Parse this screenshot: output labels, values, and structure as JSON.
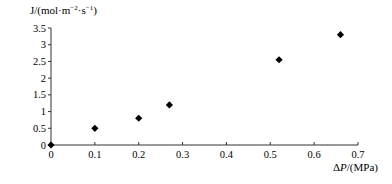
{
  "chart_data": {
    "type": "scatter",
    "title": "",
    "xlabel_prefix": "Δ",
    "xlabel_var": "P",
    "xlabel_suffix": "/(MPa)",
    "ylabel": "J/(mol·m⁻²·s⁻¹)",
    "ylabel_parts": {
      "main": "J/(mol·m",
      "sup1": "−2",
      "mid": "·s",
      "sup2": "−1",
      "end": ")"
    },
    "xlim": [
      0,
      0.7
    ],
    "ylim": [
      0,
      3.5
    ],
    "x_ticks": [
      "0",
      "0.1",
      "0.2",
      "0.3",
      "0.4",
      "0.5",
      "0.6",
      "0.7"
    ],
    "y_ticks": [
      "0",
      "0.5",
      "1",
      "1.5",
      "2",
      "2.5",
      "3",
      "3.5"
    ],
    "grid": false,
    "legend": null,
    "marker": "diamond",
    "marker_color": "#000000",
    "series": [
      {
        "name": "J",
        "x": [
          0,
          0.1,
          0.2,
          0.27,
          0.52,
          0.66
        ],
        "y": [
          0.0,
          0.5,
          0.8,
          1.2,
          2.55,
          3.3
        ]
      }
    ]
  }
}
